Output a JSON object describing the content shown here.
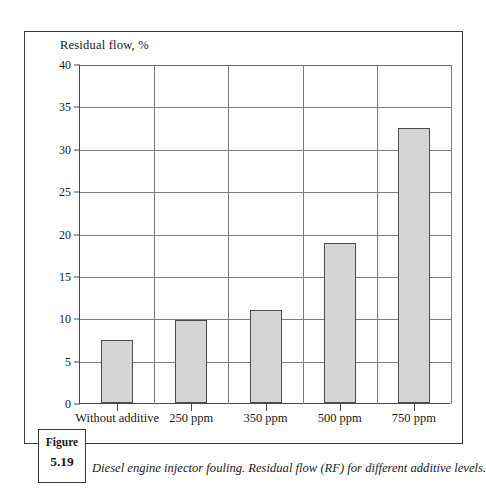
{
  "figure": {
    "tag_word": "Figure",
    "tag_number": "5.19",
    "caption": "Diesel engine injector fouling. Residual flow (RF) for different additive levels."
  },
  "chart_data": {
    "type": "bar",
    "title": "",
    "axis_title": "Residual flow, %",
    "xlabel": "",
    "ylabel": "Residual flow, %",
    "categories": [
      "Without additive",
      "250 ppm",
      "350 ppm",
      "500 ppm",
      "750 ppm"
    ],
    "values": [
      7.4,
      9.8,
      11.0,
      18.9,
      32.4
    ],
    "ylim": [
      0,
      40
    ],
    "yticks": [
      0,
      5,
      10,
      15,
      20,
      25,
      30,
      35,
      40
    ],
    "ytick_labels": [
      "0",
      "5",
      "10",
      "15",
      "20",
      "25",
      "30",
      "35",
      "40"
    ],
    "grid": "both",
    "legend": "none",
    "bar_color": "#d5d5d5",
    "bar_border_color": "#4c4c4c",
    "grid_color": "#7d7d7d",
    "axis_color": "#4a4a4a"
  }
}
